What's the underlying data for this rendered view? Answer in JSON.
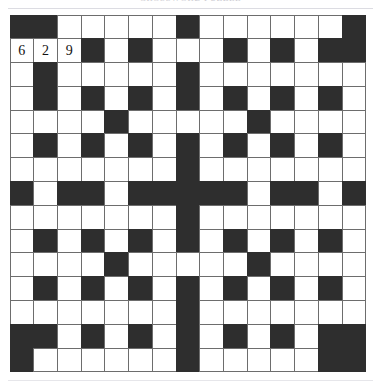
{
  "header": {
    "title": "CROSSWORD PUZZLE",
    "rule_visible": true
  },
  "puzzle": {
    "name": "crossword-grid",
    "rows": 15,
    "cols": 15,
    "colors": {
      "block": "#2e2e2e",
      "open": "#ffffff",
      "gridline": "#6d6d6d",
      "text": "#111111"
    },
    "grid": [
      [
        "B",
        "B",
        "W",
        "W",
        "W",
        "W",
        "W",
        "B",
        "W",
        "W",
        "W",
        "W",
        "W",
        "W",
        "B"
      ],
      [
        "W",
        "W",
        "W",
        "B",
        "W",
        "B",
        "W",
        "W",
        "W",
        "B",
        "W",
        "B",
        "W",
        "B",
        "B"
      ],
      [
        "W",
        "B",
        "W",
        "W",
        "W",
        "W",
        "W",
        "B",
        "W",
        "W",
        "W",
        "W",
        "W",
        "W",
        "W"
      ],
      [
        "W",
        "B",
        "W",
        "B",
        "W",
        "B",
        "W",
        "B",
        "W",
        "B",
        "W",
        "B",
        "W",
        "B",
        "W"
      ],
      [
        "W",
        "W",
        "W",
        "W",
        "B",
        "W",
        "W",
        "W",
        "W",
        "W",
        "B",
        "W",
        "W",
        "W",
        "W"
      ],
      [
        "W",
        "B",
        "W",
        "B",
        "W",
        "B",
        "W",
        "B",
        "W",
        "B",
        "W",
        "B",
        "W",
        "B",
        "W"
      ],
      [
        "W",
        "W",
        "W",
        "W",
        "W",
        "W",
        "W",
        "B",
        "W",
        "W",
        "W",
        "W",
        "W",
        "W",
        "W"
      ],
      [
        "B",
        "W",
        "B",
        "B",
        "W",
        "B",
        "B",
        "B",
        "B",
        "B",
        "W",
        "B",
        "B",
        "W",
        "B"
      ],
      [
        "W",
        "W",
        "W",
        "W",
        "W",
        "W",
        "W",
        "B",
        "W",
        "W",
        "W",
        "W",
        "W",
        "W",
        "W"
      ],
      [
        "W",
        "B",
        "W",
        "B",
        "W",
        "B",
        "W",
        "B",
        "W",
        "B",
        "W",
        "B",
        "W",
        "B",
        "W"
      ],
      [
        "W",
        "W",
        "W",
        "W",
        "B",
        "W",
        "W",
        "W",
        "W",
        "W",
        "B",
        "W",
        "W",
        "W",
        "W"
      ],
      [
        "W",
        "B",
        "W",
        "B",
        "W",
        "B",
        "W",
        "B",
        "W",
        "B",
        "W",
        "B",
        "W",
        "B",
        "W"
      ],
      [
        "W",
        "W",
        "W",
        "W",
        "W",
        "W",
        "W",
        "B",
        "W",
        "W",
        "W",
        "W",
        "W",
        "W",
        "W"
      ],
      [
        "B",
        "B",
        "W",
        "B",
        "W",
        "B",
        "W",
        "B",
        "W",
        "B",
        "W",
        "B",
        "W",
        "B",
        "B"
      ],
      [
        "B",
        "W",
        "W",
        "W",
        "W",
        "W",
        "W",
        "B",
        "W",
        "W",
        "W",
        "W",
        "W",
        "B",
        "B"
      ]
    ],
    "entries": [
      {
        "row": 1,
        "col": 0,
        "value": "6"
      },
      {
        "row": 1,
        "col": 1,
        "value": "2"
      },
      {
        "row": 1,
        "col": 2,
        "value": "9"
      }
    ]
  },
  "footer": {
    "rule_visible": true
  }
}
